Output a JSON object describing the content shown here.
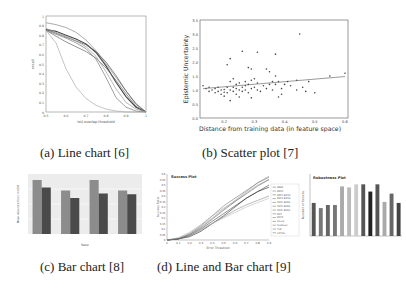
{
  "figure": {
    "captions": {
      "a": "(a) Line chart [6]",
      "b": "(b) Scatter plot [7]",
      "c": "(c) Bar chart [8]",
      "d": "(d) Line and Bar chart [9]"
    }
  },
  "chart_data": [
    {
      "id": "a",
      "type": "line",
      "title": "",
      "xlabel": "IoU overlap threshold",
      "ylabel": "recall",
      "xlim": [
        0.5,
        1
      ],
      "ylim": [
        0,
        1
      ],
      "xticks": [
        "0.5",
        "0.6",
        "0.7",
        "0.8",
        "0.9",
        "1"
      ],
      "yticks": [
        "0",
        "0.1",
        "0.2",
        "0.3",
        "0.4",
        "0.5",
        "0.6",
        "0.7",
        "0.8",
        "0.9",
        "1"
      ],
      "grid": false,
      "x": [
        0.5,
        0.55,
        0.6,
        0.65,
        0.7,
        0.75,
        0.8,
        0.85,
        0.9,
        0.95,
        1.0
      ],
      "series": [
        {
          "name": "s1",
          "values": [
            0.93,
            0.91,
            0.88,
            0.83,
            0.75,
            0.64,
            0.5,
            0.36,
            0.22,
            0.09,
            0.0
          ]
        },
        {
          "name": "s2",
          "values": [
            0.86,
            0.84,
            0.8,
            0.76,
            0.71,
            0.62,
            0.48,
            0.31,
            0.16,
            0.05,
            0.0
          ]
        },
        {
          "name": "s3",
          "values": [
            0.86,
            0.82,
            0.78,
            0.74,
            0.7,
            0.63,
            0.52,
            0.38,
            0.22,
            0.08,
            0.0
          ]
        },
        {
          "name": "s4",
          "values": [
            0.85,
            0.79,
            0.73,
            0.68,
            0.63,
            0.56,
            0.46,
            0.33,
            0.19,
            0.06,
            0.0
          ]
        },
        {
          "name": "s5",
          "values": [
            0.85,
            0.81,
            0.77,
            0.72,
            0.66,
            0.55,
            0.36,
            0.15,
            0.05,
            0.01,
            0.0
          ]
        },
        {
          "name": "s6",
          "values": [
            0.85,
            0.72,
            0.45,
            0.26,
            0.14,
            0.07,
            0.03,
            0.01,
            0.0,
            0.0,
            0.0
          ]
        },
        {
          "name": "s7",
          "values": [
            0.87,
            0.83,
            0.79,
            0.74,
            0.68,
            0.58,
            0.42,
            0.24,
            0.1,
            0.03,
            0.0
          ]
        }
      ]
    },
    {
      "id": "b",
      "type": "scatter",
      "title": "",
      "xlabel": "Distance from training data (in feature space)",
      "ylabel": "Epistemic Uncertainty",
      "xlim": [
        0.12,
        0.61
      ],
      "ylim": [
        0,
        3.5
      ],
      "xticks": [
        "0.2",
        "0.3",
        "0.4",
        "0.5",
        "0.6"
      ],
      "yticks": [
        "0.0",
        "0.5",
        "1.0",
        "1.5",
        "2.0",
        "2.5",
        "3.0",
        "3.5"
      ],
      "grid": false,
      "points": [
        [
          0.13,
          1.15
        ],
        [
          0.14,
          1.05
        ],
        [
          0.15,
          1.1
        ],
        [
          0.15,
          0.95
        ],
        [
          0.16,
          1.0
        ],
        [
          0.17,
          0.9
        ],
        [
          0.17,
          1.05
        ],
        [
          0.18,
          0.95
        ],
        [
          0.18,
          1.1
        ],
        [
          0.19,
          0.85
        ],
        [
          0.19,
          1.0
        ],
        [
          0.2,
          0.92
        ],
        [
          0.2,
          1.02
        ],
        [
          0.2,
          0.78
        ],
        [
          0.21,
          1.1
        ],
        [
          0.21,
          0.9
        ],
        [
          0.21,
          1.9
        ],
        [
          0.22,
          0.62
        ],
        [
          0.22,
          1.0
        ],
        [
          0.22,
          1.3
        ],
        [
          0.22,
          2.12
        ],
        [
          0.23,
          0.95
        ],
        [
          0.23,
          1.1
        ],
        [
          0.23,
          1.4
        ],
        [
          0.24,
          0.85
        ],
        [
          0.24,
          1.2
        ],
        [
          0.24,
          1.05
        ],
        [
          0.25,
          0.75
        ],
        [
          0.25,
          1.0
        ],
        [
          0.25,
          1.25
        ],
        [
          0.26,
          2.38
        ],
        [
          0.26,
          1.1
        ],
        [
          0.26,
          0.95
        ],
        [
          0.27,
          1.0
        ],
        [
          0.27,
          1.3
        ],
        [
          0.27,
          1.15
        ],
        [
          0.28,
          0.9
        ],
        [
          0.28,
          1.8
        ],
        [
          0.28,
          1.2
        ],
        [
          0.29,
          0.72
        ],
        [
          0.29,
          1.35
        ],
        [
          0.29,
          1.75
        ],
        [
          0.29,
          1.05
        ],
        [
          0.3,
          1.1
        ],
        [
          0.3,
          1.4
        ],
        [
          0.31,
          1.0
        ],
        [
          0.31,
          2.35
        ],
        [
          0.31,
          1.25
        ],
        [
          0.32,
          0.95
        ],
        [
          0.33,
          1.15
        ],
        [
          0.34,
          1.75
        ],
        [
          0.34,
          1.05
        ],
        [
          0.35,
          1.65
        ],
        [
          0.35,
          1.2
        ],
        [
          0.36,
          1.0
        ],
        [
          0.36,
          1.3
        ],
        [
          0.37,
          2.28
        ],
        [
          0.37,
          1.5
        ],
        [
          0.37,
          1.2
        ],
        [
          0.38,
          0.75
        ],
        [
          0.38,
          1.3
        ],
        [
          0.39,
          0.85
        ],
        [
          0.39,
          1.05
        ],
        [
          0.4,
          1.2
        ],
        [
          0.41,
          1.3
        ],
        [
          0.42,
          1.15
        ],
        [
          0.44,
          1.35
        ],
        [
          0.44,
          1.0
        ],
        [
          0.45,
          3.0
        ],
        [
          0.46,
          1.1
        ],
        [
          0.47,
          0.95
        ],
        [
          0.48,
          1.3
        ],
        [
          0.5,
          0.9
        ],
        [
          0.55,
          1.5
        ],
        [
          0.6,
          1.6
        ]
      ],
      "trendline": {
        "x": [
          0.13,
          0.6
        ],
        "y": [
          1.05,
          1.48
        ]
      }
    },
    {
      "id": "c",
      "type": "bar",
      "title": "",
      "xlabel": "Rater",
      "ylabel": "Mean Absolute Error in EDR",
      "categories": [
        "c1",
        "c2",
        "c3",
        "c4"
      ],
      "series": [
        {
          "name": "light",
          "color": "#8c8c8c",
          "values": [
            0.72,
            0.58,
            0.72,
            0.58
          ]
        },
        {
          "name": "dark",
          "color": "#4a4a4a",
          "values": [
            0.62,
            0.48,
            0.54,
            0.53
          ]
        }
      ],
      "ylim": [
        0,
        0.8
      ],
      "grid": true
    },
    {
      "id": "d1",
      "type": "line",
      "title": "Success Plot",
      "xlabel": "Error Threshold",
      "ylabel": "Success Ratio",
      "xlim": [
        0,
        0.9
      ],
      "ylim": [
        0,
        0.6
      ],
      "xticks": [
        "0",
        "0.1",
        "0.2",
        "0.3",
        "0.4",
        "0.5",
        "0.6",
        "0.7",
        "0.8",
        "0.9"
      ],
      "yticks": [
        "0",
        "0.05",
        "0.1",
        "0.15",
        "0.2",
        "0.25",
        "0.3",
        "0.35",
        "0.4",
        "0.45",
        "0.5",
        "0.55",
        "0.6"
      ],
      "x": [
        0,
        0.1,
        0.2,
        0.3,
        0.4,
        0.5,
        0.6,
        0.7,
        0.8,
        0.9
      ],
      "series": [
        {
          "name": "s1",
          "values": [
            0,
            0.01,
            0.05,
            0.12,
            0.2,
            0.28,
            0.36,
            0.44,
            0.52,
            0.58
          ]
        },
        {
          "name": "s2",
          "values": [
            0,
            0.01,
            0.06,
            0.13,
            0.22,
            0.31,
            0.38,
            0.45,
            0.52,
            0.57
          ]
        },
        {
          "name": "s3",
          "values": [
            0,
            0.02,
            0.07,
            0.14,
            0.22,
            0.29,
            0.35,
            0.43,
            0.5,
            0.55
          ]
        },
        {
          "name": "s4",
          "values": [
            0,
            0.01,
            0.04,
            0.1,
            0.17,
            0.24,
            0.31,
            0.38,
            0.44,
            0.5
          ]
        },
        {
          "name": "s5",
          "values": [
            0,
            0.01,
            0.03,
            0.08,
            0.15,
            0.22,
            0.3,
            0.38,
            0.44,
            0.48
          ]
        },
        {
          "name": "s6",
          "values": [
            0,
            0.01,
            0.04,
            0.09,
            0.15,
            0.21,
            0.27,
            0.32,
            0.36,
            0.4
          ]
        },
        {
          "name": "s7",
          "values": [
            0,
            0.02,
            0.05,
            0.1,
            0.15,
            0.2,
            0.25,
            0.3,
            0.34,
            0.38
          ]
        },
        {
          "name": "s8",
          "values": [
            0,
            0.01,
            0.05,
            0.11,
            0.19,
            0.27,
            0.35,
            0.42,
            0.49,
            0.55
          ]
        }
      ],
      "legend": {
        "position": "right",
        "entries": [
          "MEEF",
          "MRPF",
          "DRPF BOOS",
          "DRPF BOOS",
          "CRPF BOOS",
          "CRPF BOOS",
          "CRPF BOOS",
          "MCT",
          "MCTF",
          "Struck",
          "TopDown",
          "TLD",
          "LOT/KL"
        ]
      }
    },
    {
      "id": "d2",
      "type": "bar",
      "title": "Robustness Plot",
      "ylabel": "Number of Failures",
      "categories": [
        "b1",
        "b2",
        "b3",
        "b4",
        "b5",
        "b6",
        "b7",
        "b8",
        "b9",
        "b10",
        "b11",
        "b12",
        "b13",
        "b14"
      ],
      "values": [
        160,
        135,
        150,
        150,
        240,
        235,
        250,
        250,
        215,
        250,
        165,
        205,
        160,
        null
      ],
      "colors": [
        "#555",
        "#777",
        "#666",
        "#777",
        "#aaa",
        "#bbb",
        "#ccc",
        "#555",
        "#222",
        "#555",
        "#aaa",
        "#666",
        "#444"
      ],
      "ylim": [
        0,
        300
      ]
    }
  ]
}
